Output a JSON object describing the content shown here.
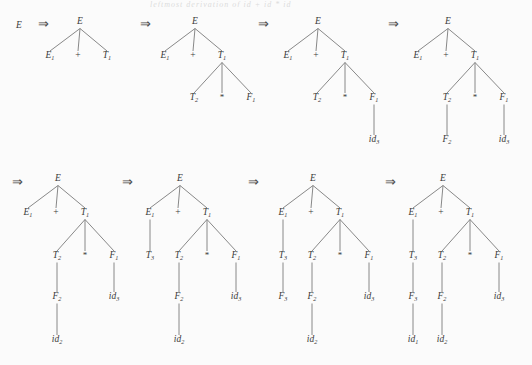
{
  "figure": {
    "title_fragment": "leftmost derivation of id + id * id",
    "background": "#fbfbfb",
    "ink": "#3a3a3a",
    "edge_color": "#7b7b7b",
    "arrow_symbol": "⇒",
    "plus_symbol": "+",
    "star_symbol": "*",
    "start_symbol": "E"
  },
  "labels": {
    "E": "E",
    "E1": "E",
    "E1_sub": "1",
    "T1": "T",
    "T1_sub": "1",
    "T2": "T",
    "T2_sub": "2",
    "T3": "T",
    "T3_sub": "3",
    "F1": "F",
    "F1_sub": "1",
    "F2": "F",
    "F2_sub": "2",
    "F3": "F",
    "F3_sub": "3",
    "id1": "id",
    "id1_sub": "1",
    "id2": "id",
    "id2_sub": "2",
    "id3": "id",
    "id3_sub": "3"
  },
  "derivation": {
    "steps": [
      {
        "index": 0,
        "kind": "symbol",
        "text": "E"
      },
      {
        "index": 1,
        "kind": "tree",
        "sentential_form": "E1 + T1",
        "nodes": [
          "E",
          "E1",
          "+",
          "T1"
        ]
      },
      {
        "index": 2,
        "kind": "tree",
        "sentential_form": "E1 + T2 * F1",
        "nodes": [
          "E",
          "E1",
          "+",
          "T1",
          "T2",
          "*",
          "F1"
        ]
      },
      {
        "index": 3,
        "kind": "tree",
        "sentential_form": "E1 + T2 * id3",
        "nodes": [
          "E",
          "E1",
          "+",
          "T1",
          "T2",
          "*",
          "F1",
          "id3"
        ]
      },
      {
        "index": 4,
        "kind": "tree",
        "sentential_form": "E1 + F2 * id3",
        "nodes": [
          "E",
          "E1",
          "+",
          "T1",
          "T2",
          "*",
          "F1",
          "F2",
          "id3"
        ]
      },
      {
        "index": 5,
        "kind": "tree",
        "sentential_form": "E1 + id2 * id3",
        "nodes": [
          "E",
          "E1",
          "+",
          "T1",
          "T2",
          "*",
          "F1",
          "F2",
          "id3",
          "id2"
        ]
      },
      {
        "index": 6,
        "kind": "tree",
        "sentential_form": "T3 + id2 * id3",
        "nodes": [
          "E",
          "E1",
          "+",
          "T1",
          "T3",
          "T2",
          "*",
          "F1",
          "F2",
          "id3",
          "id2"
        ]
      },
      {
        "index": 7,
        "kind": "tree",
        "sentential_form": "F3 + id2 * id3",
        "nodes": [
          "E",
          "E1",
          "+",
          "T1",
          "T3",
          "F3",
          "T2",
          "*",
          "F1",
          "F2",
          "id3",
          "id2"
        ]
      },
      {
        "index": 8,
        "kind": "tree",
        "sentential_form": "id1 + id2 * id3",
        "nodes": [
          "E",
          "E1",
          "+",
          "T1",
          "T3",
          "F3",
          "id1",
          "T2",
          "*",
          "F1",
          "F2",
          "id3",
          "id2"
        ]
      }
    ]
  },
  "rows": [
    {
      "row": 1,
      "lead_symbol": "E",
      "items": [
        {
          "tree": 1,
          "arrow_before": true
        },
        {
          "tree": 2,
          "arrow_before": true
        },
        {
          "tree": 3,
          "arrow_before": true
        },
        {
          "tree": 4,
          "arrow_before": true
        }
      ],
      "trailing_arrow": true
    },
    {
      "row": 2,
      "lead_arrow": true,
      "items": [
        {
          "tree": 5,
          "arrow_before": false
        },
        {
          "tree": 6,
          "arrow_before": true
        },
        {
          "tree": 7,
          "arrow_before": true
        },
        {
          "tree": 8,
          "arrow_before": true
        }
      ]
    }
  ],
  "trees": [
    {
      "id": "t1",
      "row": 1,
      "ox": 80,
      "oy": 24,
      "nodes": [
        {
          "name": "root-E",
          "base": "E",
          "sub": "",
          "x": 0,
          "y": 0
        },
        {
          "name": "E1",
          "base": "E",
          "sub": "1",
          "x": -30,
          "y": 34
        },
        {
          "name": "plus",
          "base": "+",
          "sub": "",
          "x": -2,
          "y": 34,
          "op": true
        },
        {
          "name": "T1",
          "base": "T",
          "sub": "1",
          "x": 27,
          "y": 34
        }
      ],
      "edges": [
        [
          0,
          1
        ],
        [
          0,
          2
        ],
        [
          0,
          3
        ]
      ]
    },
    {
      "id": "t2",
      "row": 1,
      "ox": 195,
      "oy": 24,
      "nodes": [
        {
          "name": "root-E",
          "base": "E",
          "sub": "",
          "x": 0,
          "y": 0
        },
        {
          "name": "E1",
          "base": "E",
          "sub": "1",
          "x": -30,
          "y": 34
        },
        {
          "name": "plus",
          "base": "+",
          "sub": "",
          "x": -2,
          "y": 34,
          "op": true
        },
        {
          "name": "T1",
          "base": "T",
          "sub": "1",
          "x": 27,
          "y": 34
        },
        {
          "name": "T2",
          "base": "T",
          "sub": "2",
          "x": -1,
          "y": 76
        },
        {
          "name": "star",
          "base": "*",
          "sub": "",
          "x": 27,
          "y": 76,
          "star": true
        },
        {
          "name": "F1",
          "base": "F",
          "sub": "1",
          "x": 56,
          "y": 76
        }
      ],
      "edges": [
        [
          0,
          1
        ],
        [
          0,
          2
        ],
        [
          0,
          3
        ],
        [
          3,
          4
        ],
        [
          3,
          5
        ],
        [
          3,
          6
        ]
      ]
    },
    {
      "id": "t3",
      "row": 1,
      "ox": 318,
      "oy": 24,
      "nodes": [
        {
          "name": "root-E",
          "base": "E",
          "sub": "",
          "x": 0,
          "y": 0
        },
        {
          "name": "E1",
          "base": "E",
          "sub": "1",
          "x": -30,
          "y": 34
        },
        {
          "name": "plus",
          "base": "+",
          "sub": "",
          "x": -2,
          "y": 34,
          "op": true
        },
        {
          "name": "T1",
          "base": "T",
          "sub": "1",
          "x": 27,
          "y": 34
        },
        {
          "name": "T2",
          "base": "T",
          "sub": "2",
          "x": -1,
          "y": 76
        },
        {
          "name": "star",
          "base": "*",
          "sub": "",
          "x": 27,
          "y": 76,
          "star": true
        },
        {
          "name": "F1",
          "base": "F",
          "sub": "1",
          "x": 56,
          "y": 76
        },
        {
          "name": "id3",
          "base": "id",
          "sub": "3",
          "x": 56,
          "y": 118
        }
      ],
      "edges": [
        [
          0,
          1
        ],
        [
          0,
          2
        ],
        [
          0,
          3
        ],
        [
          3,
          4
        ],
        [
          3,
          5
        ],
        [
          3,
          6
        ],
        [
          6,
          7
        ]
      ]
    },
    {
      "id": "t4",
      "row": 1,
      "ox": 448,
      "oy": 24,
      "nodes": [
        {
          "name": "root-E",
          "base": "E",
          "sub": "",
          "x": 0,
          "y": 0
        },
        {
          "name": "E1",
          "base": "E",
          "sub": "1",
          "x": -30,
          "y": 34
        },
        {
          "name": "plus",
          "base": "+",
          "sub": "",
          "x": -2,
          "y": 34,
          "op": true
        },
        {
          "name": "T1",
          "base": "T",
          "sub": "1",
          "x": 27,
          "y": 34
        },
        {
          "name": "T2",
          "base": "T",
          "sub": "2",
          "x": -1,
          "y": 76
        },
        {
          "name": "star",
          "base": "*",
          "sub": "",
          "x": 27,
          "y": 76,
          "star": true
        },
        {
          "name": "F1",
          "base": "F",
          "sub": "1",
          "x": 56,
          "y": 76
        },
        {
          "name": "id3",
          "base": "id",
          "sub": "3",
          "x": 56,
          "y": 118
        },
        {
          "name": "F2",
          "base": "F",
          "sub": "2",
          "x": -1,
          "y": 118
        }
      ],
      "edges": [
        [
          0,
          1
        ],
        [
          0,
          2
        ],
        [
          0,
          3
        ],
        [
          3,
          4
        ],
        [
          3,
          5
        ],
        [
          3,
          6
        ],
        [
          6,
          7
        ],
        [
          4,
          8
        ]
      ]
    },
    {
      "id": "t5",
      "row": 2,
      "ox": 58,
      "oy": 181,
      "nodes": [
        {
          "name": "root-E",
          "base": "E",
          "sub": "",
          "x": 0,
          "y": 0
        },
        {
          "name": "E1",
          "base": "E",
          "sub": "1",
          "x": -30,
          "y": 34
        },
        {
          "name": "plus",
          "base": "+",
          "sub": "",
          "x": -2,
          "y": 34,
          "op": true
        },
        {
          "name": "T1",
          "base": "T",
          "sub": "1",
          "x": 27,
          "y": 34
        },
        {
          "name": "T2",
          "base": "T",
          "sub": "2",
          "x": -1,
          "y": 77
        },
        {
          "name": "star",
          "base": "*",
          "sub": "",
          "x": 27,
          "y": 77,
          "star": true
        },
        {
          "name": "F1",
          "base": "F",
          "sub": "1",
          "x": 56,
          "y": 77
        },
        {
          "name": "id3",
          "base": "id",
          "sub": "3",
          "x": 56,
          "y": 118
        },
        {
          "name": "F2",
          "base": "F",
          "sub": "2",
          "x": -1,
          "y": 118
        },
        {
          "name": "id2",
          "base": "id",
          "sub": "2",
          "x": -1,
          "y": 161
        }
      ],
      "edges": [
        [
          0,
          1
        ],
        [
          0,
          2
        ],
        [
          0,
          3
        ],
        [
          3,
          4
        ],
        [
          3,
          5
        ],
        [
          3,
          6
        ],
        [
          6,
          7
        ],
        [
          4,
          8
        ],
        [
          8,
          9
        ]
      ]
    },
    {
      "id": "t6",
      "row": 2,
      "ox": 180,
      "oy": 181,
      "nodes": [
        {
          "name": "root-E",
          "base": "E",
          "sub": "",
          "x": 0,
          "y": 0
        },
        {
          "name": "E1",
          "base": "E",
          "sub": "1",
          "x": -30,
          "y": 34
        },
        {
          "name": "plus",
          "base": "+",
          "sub": "",
          "x": -2,
          "y": 34,
          "op": true
        },
        {
          "name": "T1",
          "base": "T",
          "sub": "1",
          "x": 27,
          "y": 34
        },
        {
          "name": "T3",
          "base": "T",
          "sub": "3",
          "x": -30,
          "y": 77
        },
        {
          "name": "T2",
          "base": "T",
          "sub": "2",
          "x": -1,
          "y": 77
        },
        {
          "name": "star",
          "base": "*",
          "sub": "",
          "x": 27,
          "y": 77,
          "star": true
        },
        {
          "name": "F1",
          "base": "F",
          "sub": "1",
          "x": 56,
          "y": 77
        },
        {
          "name": "id3",
          "base": "id",
          "sub": "3",
          "x": 56,
          "y": 118
        },
        {
          "name": "F2",
          "base": "F",
          "sub": "2",
          "x": -1,
          "y": 118
        },
        {
          "name": "id2",
          "base": "id",
          "sub": "2",
          "x": -1,
          "y": 161
        }
      ],
      "edges": [
        [
          0,
          1
        ],
        [
          0,
          2
        ],
        [
          0,
          3
        ],
        [
          1,
          4
        ],
        [
          3,
          5
        ],
        [
          3,
          6
        ],
        [
          3,
          7
        ],
        [
          7,
          8
        ],
        [
          5,
          9
        ],
        [
          9,
          10
        ]
      ]
    },
    {
      "id": "t7",
      "row": 2,
      "ox": 313,
      "oy": 181,
      "nodes": [
        {
          "name": "root-E",
          "base": "E",
          "sub": "",
          "x": 0,
          "y": 0
        },
        {
          "name": "E1",
          "base": "E",
          "sub": "1",
          "x": -30,
          "y": 34
        },
        {
          "name": "plus",
          "base": "+",
          "sub": "",
          "x": -2,
          "y": 34,
          "op": true
        },
        {
          "name": "T1",
          "base": "T",
          "sub": "1",
          "x": 27,
          "y": 34
        },
        {
          "name": "T3",
          "base": "T",
          "sub": "3",
          "x": -30,
          "y": 77
        },
        {
          "name": "F3",
          "base": "F",
          "sub": "3",
          "x": -30,
          "y": 118
        },
        {
          "name": "T2",
          "base": "T",
          "sub": "2",
          "x": -1,
          "y": 77
        },
        {
          "name": "star",
          "base": "*",
          "sub": "",
          "x": 27,
          "y": 77,
          "star": true
        },
        {
          "name": "F1",
          "base": "F",
          "sub": "1",
          "x": 56,
          "y": 77
        },
        {
          "name": "id3",
          "base": "id",
          "sub": "3",
          "x": 56,
          "y": 118
        },
        {
          "name": "F2",
          "base": "F",
          "sub": "2",
          "x": -1,
          "y": 118
        },
        {
          "name": "id2",
          "base": "id",
          "sub": "2",
          "x": -1,
          "y": 161
        }
      ],
      "edges": [
        [
          0,
          1
        ],
        [
          0,
          2
        ],
        [
          0,
          3
        ],
        [
          1,
          4
        ],
        [
          4,
          5
        ],
        [
          3,
          6
        ],
        [
          3,
          7
        ],
        [
          3,
          8
        ],
        [
          8,
          9
        ],
        [
          6,
          10
        ],
        [
          10,
          11
        ]
      ]
    },
    {
      "id": "t8",
      "row": 2,
      "ox": 443,
      "oy": 181,
      "nodes": [
        {
          "name": "root-E",
          "base": "E",
          "sub": "",
          "x": 0,
          "y": 0
        },
        {
          "name": "E1",
          "base": "E",
          "sub": "1",
          "x": -30,
          "y": 34
        },
        {
          "name": "plus",
          "base": "+",
          "sub": "",
          "x": -2,
          "y": 34,
          "op": true
        },
        {
          "name": "T1",
          "base": "T",
          "sub": "1",
          "x": 27,
          "y": 34
        },
        {
          "name": "T3",
          "base": "T",
          "sub": "3",
          "x": -30,
          "y": 77
        },
        {
          "name": "F3",
          "base": "F",
          "sub": "3",
          "x": -30,
          "y": 118
        },
        {
          "name": "id1",
          "base": "id",
          "sub": "1",
          "x": -30,
          "y": 161
        },
        {
          "name": "T2",
          "base": "T",
          "sub": "2",
          "x": -1,
          "y": 77
        },
        {
          "name": "star",
          "base": "*",
          "sub": "",
          "x": 27,
          "y": 77,
          "star": true
        },
        {
          "name": "F1",
          "base": "F",
          "sub": "1",
          "x": 56,
          "y": 77
        },
        {
          "name": "id3",
          "base": "id",
          "sub": "3",
          "x": 56,
          "y": 118
        },
        {
          "name": "F2",
          "base": "F",
          "sub": "2",
          "x": -1,
          "y": 118
        },
        {
          "name": "id2",
          "base": "id",
          "sub": "2",
          "x": -1,
          "y": 161
        }
      ],
      "edges": [
        [
          0,
          1
        ],
        [
          0,
          2
        ],
        [
          0,
          3
        ],
        [
          1,
          4
        ],
        [
          4,
          5
        ],
        [
          5,
          6
        ],
        [
          3,
          7
        ],
        [
          3,
          8
        ],
        [
          3,
          9
        ],
        [
          9,
          10
        ],
        [
          7,
          11
        ],
        [
          11,
          12
        ]
      ]
    }
  ],
  "arrows": [
    {
      "name": "arrow-0",
      "x": 38,
      "y": 28
    },
    {
      "name": "arrow-1",
      "x": 140,
      "y": 28
    },
    {
      "name": "arrow-2",
      "x": 258,
      "y": 28
    },
    {
      "name": "arrow-3",
      "x": 388,
      "y": 28
    },
    {
      "name": "arrow-4",
      "x": 12,
      "y": 186
    },
    {
      "name": "arrow-5",
      "x": 122,
      "y": 186
    },
    {
      "name": "arrow-6",
      "x": 248,
      "y": 186
    },
    {
      "name": "arrow-7",
      "x": 385,
      "y": 186
    }
  ],
  "lead_symbols": [
    {
      "name": "start-symbol-E",
      "x": 19,
      "y": 28,
      "text": "E"
    }
  ]
}
